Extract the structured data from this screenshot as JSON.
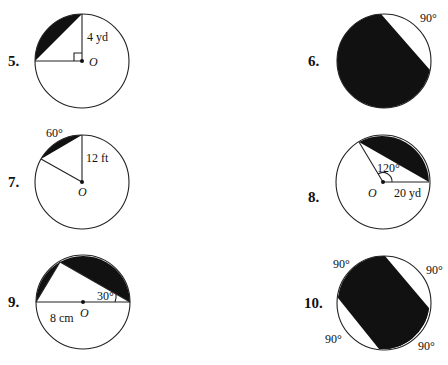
{
  "problems": [
    {
      "number": "5.",
      "labels": {
        "radius": "4 yd",
        "center": "O"
      },
      "marks": [
        "right-angle"
      ]
    },
    {
      "number": "6.",
      "labels": {
        "arc": "90°"
      }
    },
    {
      "number": "7.",
      "labels": {
        "arc": "60°",
        "radius": "12 ft",
        "center": "O"
      }
    },
    {
      "number": "8.",
      "labels": {
        "angle": "120°",
        "radius": "20 yd",
        "center": "O"
      }
    },
    {
      "number": "9.",
      "labels": {
        "angle": "30°",
        "radius": "8 cm",
        "center": "O"
      }
    },
    {
      "number": "10.",
      "labels": {
        "arc_tl": "90°",
        "arc_tr": "90°",
        "arc_bl": "90°",
        "arc_br": "90°"
      }
    }
  ],
  "colors": {
    "shade": "#111111",
    "line": "#222222",
    "background": "#ffffff"
  }
}
